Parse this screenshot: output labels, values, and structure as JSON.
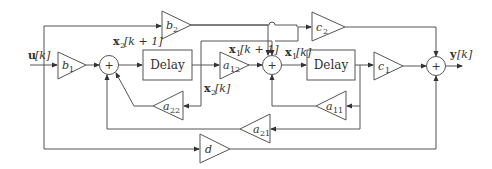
{
  "diagram": {
    "type": "block-diagram",
    "title": "",
    "input": {
      "symbol": "u",
      "index": "[k]"
    },
    "output": {
      "symbol": "y",
      "index": "[k]"
    },
    "delays": [
      {
        "id": "delay1",
        "label": "Delay",
        "in_label": {
          "symbol": "x",
          "sub": "2",
          "index": "[k + 1]"
        },
        "out_label": {
          "symbol": "x",
          "sub": "2",
          "index": "[k]"
        }
      },
      {
        "id": "delay2",
        "label": "Delay",
        "in_label": {
          "symbol": "x",
          "sub": "1",
          "index": "[k + 1]"
        },
        "out_label": {
          "symbol": "x",
          "sub": "1",
          "index": "[k]"
        }
      }
    ],
    "gains": [
      {
        "id": "b1",
        "base": "b",
        "sub": "1"
      },
      {
        "id": "b2",
        "base": "b",
        "sub": "2"
      },
      {
        "id": "a12",
        "base": "a",
        "sub": "12"
      },
      {
        "id": "a22",
        "base": "a",
        "sub": "22"
      },
      {
        "id": "a11",
        "base": "a",
        "sub": "11"
      },
      {
        "id": "a21",
        "base": "a",
        "sub": "21"
      },
      {
        "id": "c1",
        "base": "c",
        "sub": "1"
      },
      {
        "id": "c2",
        "base": "c",
        "sub": "2"
      },
      {
        "id": "d",
        "base": "d",
        "sub": ""
      }
    ],
    "summers": [
      {
        "id": "sum1",
        "symbol": "+"
      },
      {
        "id": "sum2",
        "symbol": "+"
      },
      {
        "id": "sum3",
        "symbol": "+"
      }
    ],
    "colors": {
      "line": "#555555",
      "text": "#333333",
      "background": "#ffffff"
    }
  }
}
